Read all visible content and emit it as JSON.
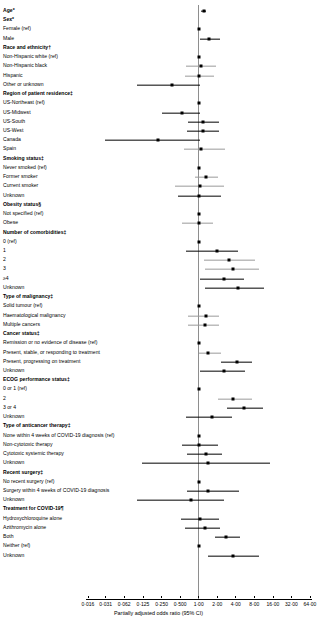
{
  "chart_data": {
    "type": "forest",
    "title": "",
    "xlabel": "Partially adjusted odds ratio (95% CI)",
    "xscale": "log2",
    "xlim": [
      0.016,
      64.0
    ],
    "xticks": [
      "0·016",
      "0·031",
      "0·062",
      "0·125",
      "0·250",
      "0·500",
      "1·00",
      "2·00",
      "4·00",
      "8·00",
      "16·00",
      "32·00",
      "64·00"
    ],
    "xtick_values": [
      0.016,
      0.031,
      0.062,
      0.125,
      0.25,
      0.5,
      1.0,
      2.0,
      4.0,
      8.0,
      16.0,
      32.0,
      64.0
    ],
    "refline": 1.0,
    "grid": false,
    "legend": "none",
    "rows": [
      {
        "label": "Age*",
        "header": true,
        "est": 1.21,
        "lo": 1.11,
        "hi": 1.33,
        "faint": false
      },
      {
        "label": "Sex*",
        "header": true
      },
      {
        "label": "Female (ref)",
        "header": false,
        "est": 1.0,
        "ref": true
      },
      {
        "label": "Male",
        "header": false,
        "est": 1.49,
        "lo": 1.05,
        "hi": 2.22,
        "faint": false
      },
      {
        "label": "Race and ethnicity†",
        "header": true
      },
      {
        "label": "Non-Hispanic white (ref)",
        "header": false,
        "est": 1.0,
        "ref": true
      },
      {
        "label": "Non-Hispanic black",
        "header": false,
        "est": 1.08,
        "lo": 0.62,
        "hi": 1.88,
        "faint": true
      },
      {
        "label": "Hispanic",
        "header": false,
        "est": 1.02,
        "lo": 0.6,
        "hi": 1.78,
        "faint": true
      },
      {
        "label": "Other or unknown",
        "header": false,
        "est": 0.37,
        "lo": 0.1,
        "hi": 1.05,
        "faint": false
      },
      {
        "label": "Region of patient residence‡",
        "header": true
      },
      {
        "label": "US-Northeast (ref)",
        "header": false,
        "est": 1.0,
        "ref": true
      },
      {
        "label": "US-Midwest",
        "header": false,
        "est": 0.53,
        "lo": 0.25,
        "hi": 1.05,
        "faint": false
      },
      {
        "label": "US-South",
        "header": false,
        "est": 1.19,
        "lo": 0.68,
        "hi": 2.1,
        "faint": false
      },
      {
        "label": "US-West",
        "header": false,
        "est": 1.18,
        "lo": 0.64,
        "hi": 2.1,
        "faint": false
      },
      {
        "label": "Canada",
        "header": false,
        "est": 0.22,
        "lo": 0.03,
        "hi": 1.07,
        "faint": false
      },
      {
        "label": "Spain",
        "header": false,
        "est": 1.1,
        "lo": 0.58,
        "hi": 2.7,
        "faint": true
      },
      {
        "label": "Smoking status‡",
        "header": true
      },
      {
        "label": "Never smoked (ref)",
        "header": false,
        "est": 1.0,
        "ref": true
      },
      {
        "label": "Former smoker",
        "header": false,
        "est": 1.3,
        "lo": 0.88,
        "hi": 2.05,
        "faint": true
      },
      {
        "label": "Current smoker",
        "header": false,
        "est": 1.05,
        "lo": 0.42,
        "hi": 2.55,
        "faint": true
      },
      {
        "label": "Unknown",
        "header": false,
        "est": 1.02,
        "lo": 0.46,
        "hi": 2.3,
        "faint": false
      },
      {
        "label": "Obesity status§",
        "header": true
      },
      {
        "label": "Not specified (ref)",
        "header": false,
        "est": 1.0,
        "ref": true
      },
      {
        "label": "Obese",
        "header": false,
        "est": 1.0,
        "lo": 0.54,
        "hi": 1.72,
        "faint": true
      },
      {
        "label": "Number of comorbidities‡",
        "header": true
      },
      {
        "label": "0 (ref)",
        "header": false,
        "est": 1.0,
        "ref": true
      },
      {
        "label": "1",
        "header": false,
        "est": 1.95,
        "lo": 0.63,
        "hi": 4.3,
        "faint": false
      },
      {
        "label": "2",
        "header": false,
        "est": 3.1,
        "lo": 1.2,
        "hi": 8.3,
        "faint": true
      },
      {
        "label": "3",
        "header": false,
        "est": 3.65,
        "lo": 1.25,
        "hi": 9.5,
        "faint": true
      },
      {
        "label": "≥4",
        "header": false,
        "est": 2.6,
        "lo": 1.05,
        "hi": 5.4,
        "faint": false
      },
      {
        "label": "Unknown",
        "header": false,
        "est": 4.3,
        "lo": 1.25,
        "hi": 11.5,
        "faint": false
      },
      {
        "label": "Type of malignancy‡",
        "header": true
      },
      {
        "label": "Solid tumour (ref)",
        "header": false,
        "est": 1.0,
        "ref": true
      },
      {
        "label": "Haematological malignancy",
        "header": false,
        "est": 1.3,
        "lo": 0.68,
        "hi": 2.1,
        "faint": true
      },
      {
        "label": "Multiple cancers",
        "header": false,
        "est": 1.25,
        "lo": 0.67,
        "hi": 2.1,
        "faint": true
      },
      {
        "label": "Cancer status‡",
        "header": true
      },
      {
        "label": "Remission or no evidence of disease (ref)",
        "header": false,
        "est": 1.0,
        "ref": true
      },
      {
        "label": "Present, stable, or responding to treatment",
        "header": false,
        "est": 1.42,
        "lo": 1.02,
        "hi": 2.3,
        "faint": true
      },
      {
        "label": "Present, progressing on treatment",
        "header": false,
        "est": 4.2,
        "lo": 2.3,
        "hi": 7.2,
        "faint": false
      },
      {
        "label": "Unknown",
        "header": false,
        "est": 2.6,
        "lo": 1.05,
        "hi": 5.6,
        "faint": false
      },
      {
        "label": "ECOG performance status‡",
        "header": true
      },
      {
        "label": "0 or 1 (ref)",
        "header": false,
        "est": 1.0,
        "ref": true
      },
      {
        "label": "2",
        "header": false,
        "est": 3.65,
        "lo": 2.05,
        "hi": 7.2,
        "faint": true
      },
      {
        "label": "3 or 4",
        "header": false,
        "est": 5.4,
        "lo": 2.9,
        "hi": 11.0,
        "faint": false
      },
      {
        "label": "Unknown",
        "header": false,
        "est": 1.65,
        "lo": 0.62,
        "hi": 3.5,
        "faint": false
      },
      {
        "label": "Type of anticancer therapy‡",
        "header": true
      },
      {
        "label": "None within 4 weeks of COVID-19 diagnosis (ref)",
        "header": false,
        "est": 1.0,
        "ref": true
      },
      {
        "label": "Non-cytotoxic therapy",
        "header": false,
        "est": 1.02,
        "lo": 0.53,
        "hi": 2.05,
        "faint": false
      },
      {
        "label": "Cytotoxic systemic therapy",
        "header": false,
        "est": 1.3,
        "lo": 0.65,
        "hi": 2.4,
        "faint": false
      },
      {
        "label": "Unknown",
        "header": false,
        "est": 1.4,
        "lo": 0.12,
        "hi": 14.5,
        "faint": false
      },
      {
        "label": "Recent surgery‡",
        "header": true
      },
      {
        "label": "No recent surgery (ref)",
        "header": false,
        "est": 1.0,
        "ref": true
      },
      {
        "label": "Surgery within 4 weeks of COVID-19 diagnosis",
        "header": false,
        "est": 1.42,
        "lo": 0.65,
        "hi": 4.5,
        "faint": false
      },
      {
        "label": "Unknown",
        "header": false,
        "est": 0.74,
        "lo": 0.1,
        "hi": 2.6,
        "faint": false
      },
      {
        "label": "Treatment for COVID-19¶",
        "header": true
      },
      {
        "label": "Hydroxychloroquine alone",
        "header": false,
        "est": 1.05,
        "lo": 0.52,
        "hi": 2.1,
        "faint": false
      },
      {
        "label": "Azithromycin alone",
        "header": false,
        "est": 1.25,
        "lo": 0.6,
        "hi": 2.2,
        "faint": false
      },
      {
        "label": "Both",
        "header": false,
        "est": 2.8,
        "lo": 1.85,
        "hi": 4.6,
        "faint": false
      },
      {
        "label": "Neither (ref)",
        "header": false,
        "est": 1.0,
        "ref": true
      },
      {
        "label": "Unknown",
        "header": false,
        "est": 3.6,
        "lo": 1.4,
        "hi": 9.5,
        "faint": false
      }
    ]
  },
  "colors": {
    "marker": "#000000",
    "ci": "#000000",
    "ci_faint": "#9a9a9a",
    "refline": "#8e8e8e",
    "axis": "#000000"
  }
}
